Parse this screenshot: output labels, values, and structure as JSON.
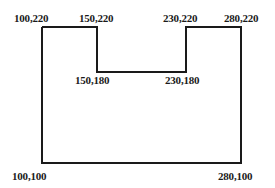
{
  "diagram": {
    "type": "polygon-outline",
    "stroke_color": "#1a1a1a",
    "vertices": [
      {
        "x": 100,
        "y": 220,
        "label": "100,220"
      },
      {
        "x": 150,
        "y": 220,
        "label": "150,220"
      },
      {
        "x": 150,
        "y": 180,
        "label": "150,180"
      },
      {
        "x": 230,
        "y": 180,
        "label": "230,180"
      },
      {
        "x": 230,
        "y": 220,
        "label": "230,220"
      },
      {
        "x": 280,
        "y": 220,
        "label": "280,220"
      },
      {
        "x": 280,
        "y": 100,
        "label": "280,100"
      },
      {
        "x": 100,
        "y": 100,
        "label": "100,100"
      }
    ]
  }
}
